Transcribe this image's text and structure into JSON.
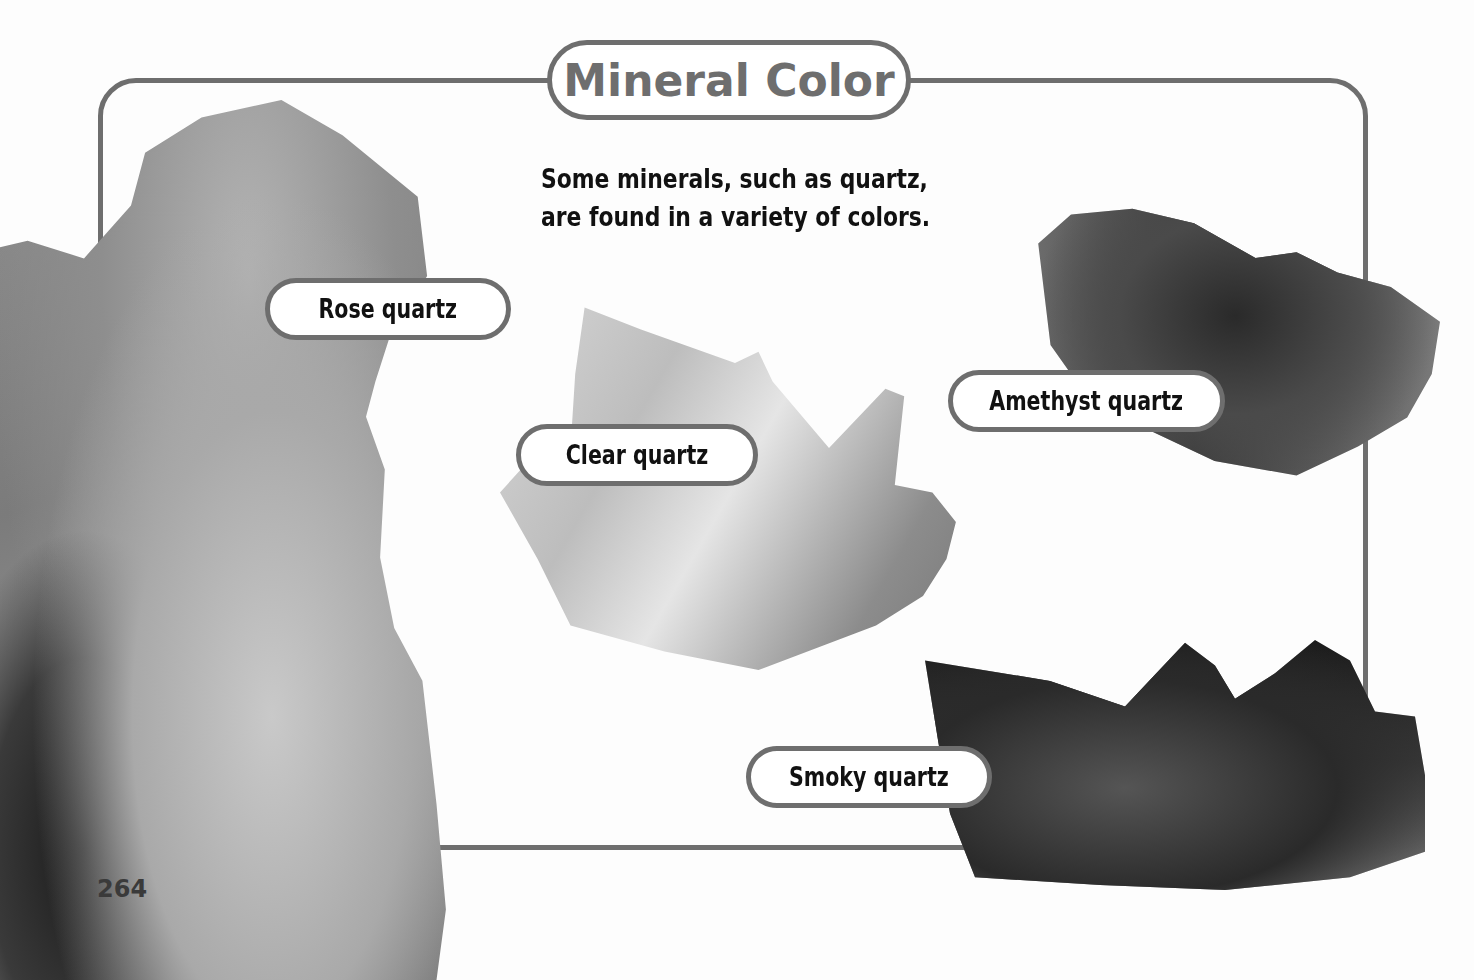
{
  "page": {
    "title": "Mineral Color",
    "intro_lines": [
      "Some minerals, such as quartz,",
      "are found in a variety of colors."
    ],
    "page_number": "264"
  },
  "minerals": [
    {
      "label": "Rose quartz",
      "image": "rose-quartz-photo"
    },
    {
      "label": "Clear quartz",
      "image": "clear-quartz-photo"
    },
    {
      "label": "Amethyst quartz",
      "image": "amethyst-quartz-photo"
    },
    {
      "label": "Smoky quartz",
      "image": "smoky-quartz-photo"
    }
  ],
  "colors": {
    "frame_border": "#6e6e6e",
    "title_text": "#6e6e6e",
    "body_text": "#111111",
    "background": "#fdfdfd"
  }
}
